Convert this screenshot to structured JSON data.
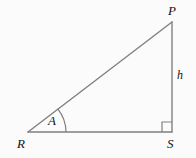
{
  "figure": {
    "background_color": "#fbfbfb",
    "stroke_color": "#808080",
    "label_color": "#111111",
    "vertices": {
      "P": {
        "label": "P",
        "x": 172,
        "y": 22
      },
      "R": {
        "label": "R",
        "x": 28,
        "y": 132
      },
      "S": {
        "label": "S",
        "x": 172,
        "y": 132
      }
    },
    "sides": {
      "hypotenuse": {
        "from": "R",
        "to": "P",
        "label": ""
      },
      "base": {
        "from": "R",
        "to": "S",
        "label": ""
      },
      "vertical": {
        "from": "P",
        "to": "S",
        "label": "h"
      }
    },
    "angles": {
      "at_R": {
        "label": "A",
        "marker": "arc",
        "radius": 38
      },
      "at_S": {
        "label": "",
        "marker": "right-angle-square",
        "size": 10
      }
    }
  }
}
